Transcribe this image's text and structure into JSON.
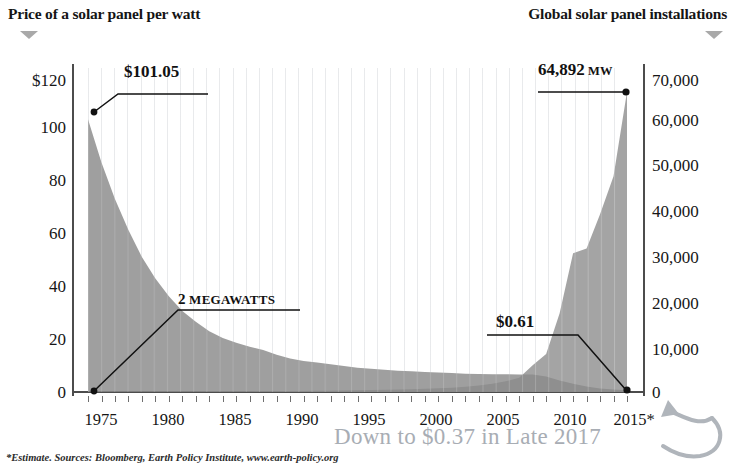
{
  "header": {
    "left_title": "Price of a solar panel per watt",
    "right_title": "Global solar panel installations",
    "left_dropdown_icon": "triangle-down-icon",
    "right_dropdown_icon": "triangle-down-icon"
  },
  "footnote": "*Estimate. Sources: Bloomberg, Earth Policy Institute, www.earth-policy.org",
  "overlay": {
    "note": "Down to $0.37 in Late 2017",
    "arrow_icon": "curved-arrow-icon",
    "color": "#a8adb4"
  },
  "annotations": {
    "price_start": {
      "label": "$101.05",
      "value": 101.05,
      "year": 1975
    },
    "price_end": {
      "label": "$0.61",
      "value": 0.61,
      "year": 2015
    },
    "install_start": {
      "label_number": "2",
      "label_unit": "MEGAWATTS",
      "value": 2,
      "year": 1975
    },
    "install_end": {
      "label_number": "64,892",
      "label_unit": "MW",
      "value": 64892,
      "year": 2015
    }
  },
  "colors": {
    "price_area": "#9a9a9a",
    "install_area": "#8e8e8e",
    "overlap_area": "#6a6a6a",
    "axis": "#4c4c4c",
    "grid": "#78808c",
    "text": "#151515"
  },
  "chart_data": {
    "type": "area",
    "subtitle": "",
    "xlabel": "",
    "ylabel": "Price of a solar panel per watt",
    "y2label": "Global solar panel installations",
    "xlim": [
      1975,
      2015
    ],
    "ylim": [
      0,
      120
    ],
    "y2lim": [
      0,
      70000
    ],
    "grid": true,
    "legend_position": "none",
    "xtick_labels": [
      "1975",
      "1980",
      "1985",
      "1990",
      "1995",
      "2000",
      "2005",
      "2010",
      "2015*"
    ],
    "xticks": [
      1975,
      1980,
      1985,
      1990,
      1995,
      2000,
      2005,
      2010,
      2015
    ],
    "ytick_labels": [
      "$120",
      "100",
      "80",
      "60",
      "40",
      "20",
      "0"
    ],
    "yticks": [
      120,
      100,
      80,
      60,
      40,
      20,
      0
    ],
    "y2tick_labels": [
      "70,000",
      "60,000",
      "50,000",
      "40,000",
      "30,000",
      "20,000",
      "10,000",
      "0"
    ],
    "y2ticks": [
      70000,
      60000,
      50000,
      40000,
      30000,
      20000,
      10000,
      0
    ],
    "x": [
      1975,
      1976,
      1977,
      1978,
      1979,
      1980,
      1981,
      1982,
      1983,
      1984,
      1985,
      1986,
      1987,
      1988,
      1989,
      1990,
      1991,
      1992,
      1993,
      1994,
      1995,
      1996,
      1997,
      1998,
      1999,
      2000,
      2001,
      2002,
      2003,
      2004,
      2005,
      2006,
      2007,
      2008,
      2009,
      2010,
      2011,
      2012,
      2013,
      2014,
      2015
    ],
    "series": [
      {
        "name": "Price of a solar panel per watt",
        "axis": "left",
        "units": "USD per watt",
        "values": [
          101.05,
          85.0,
          71.5,
          60.0,
          50.0,
          42.0,
          35.5,
          30.0,
          26.0,
          22.5,
          20.0,
          18.2,
          16.8,
          15.6,
          13.8,
          12.4,
          11.5,
          10.9,
          10.3,
          9.6,
          9.0,
          8.6,
          8.2,
          7.9,
          7.7,
          7.4,
          7.2,
          7.0,
          6.8,
          6.7,
          6.6,
          6.6,
          6.5,
          6.5,
          5.7,
          4.3,
          3.1,
          2.0,
          1.3,
          0.9,
          0.61
        ]
      },
      {
        "name": "Global solar panel installations",
        "axis": "right",
        "units": "MW",
        "values": [
          2,
          5,
          9,
          14,
          20,
          28,
          38,
          52,
          66,
          82,
          98,
          115,
          132,
          150,
          172,
          196,
          222,
          252,
          286,
          322,
          362,
          408,
          460,
          520,
          590,
          680,
          790,
          930,
          1120,
          1400,
          1760,
          2300,
          3100,
          5800,
          8200,
          17000,
          30000,
          31000,
          38400,
          46600,
          64892
        ]
      }
    ]
  }
}
